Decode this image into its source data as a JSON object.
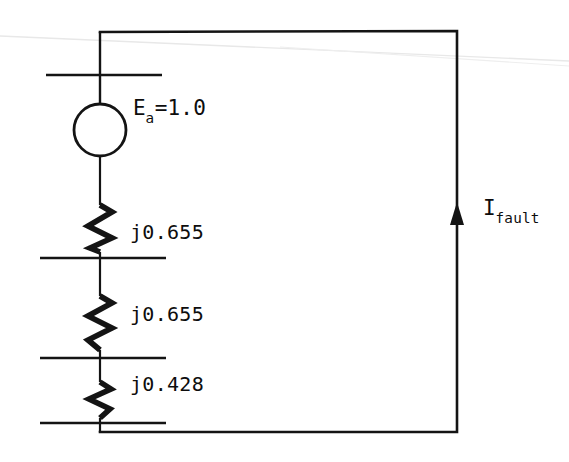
{
  "diagram": {
    "background_color": "#ffffff",
    "ink_color": "#101010",
    "artifact_color": "#e9e9e9",
    "source": {
      "symbol": "circle",
      "label_main": "E",
      "label_sub": "a",
      "label_tail": "=1.0",
      "label_full": "Ea=1.0"
    },
    "impedances": [
      {
        "name": "z1",
        "label": "j0.655"
      },
      {
        "name": "z2",
        "label": "j0.655"
      },
      {
        "name": "z3",
        "label": "j0.428"
      }
    ],
    "current": {
      "label_main": "I",
      "label_sub": "fault",
      "label_full": "Ifault",
      "direction": "up"
    },
    "buses": [
      {
        "name": "bus-top",
        "y": 75
      },
      {
        "name": "bus-second",
        "y": 258
      },
      {
        "name": "bus-third",
        "y": 358
      },
      {
        "name": "bus-bottom",
        "y": 423
      }
    ]
  }
}
